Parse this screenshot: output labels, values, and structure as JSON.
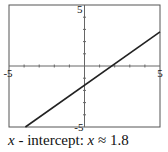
{
  "chart_data": {
    "type": "line",
    "title": "",
    "xlabel": "",
    "ylabel": "",
    "xlim": [
      -5,
      5
    ],
    "ylim": [
      -5,
      5
    ],
    "grid": false,
    "tick_step": 1,
    "tick_labels": {
      "x_min": "-5",
      "x_max": "5",
      "y_min": "-5",
      "y_max": "5"
    },
    "series": [
      {
        "name": "line",
        "x": [
          -3.914,
          5
        ],
        "y": [
          -5,
          2.8
        ],
        "slope": 0.875,
        "intercept": -1.575
      }
    ],
    "annotation": {
      "var1": "x",
      "middle": " - intercept: ",
      "var2": "x",
      "approx": " ≈ ",
      "value": "1.8"
    }
  }
}
